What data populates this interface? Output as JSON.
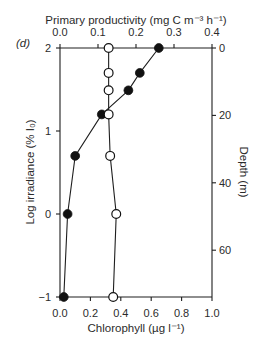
{
  "panel_label": "(d)",
  "chart_data": {
    "type": "line",
    "title": "",
    "panel": "(d)",
    "orientation": "vertical-profile",
    "top_axis": {
      "label": "Primary productivity (mg C m⁻³ h⁻¹)",
      "range": [
        0,
        0.4
      ],
      "ticks": [
        0.0,
        0.1,
        0.2,
        0.3,
        0.4
      ],
      "tick_labels": [
        "0.0",
        "0.1",
        "0.2",
        "0.3",
        "0.4"
      ]
    },
    "bottom_axis": {
      "label": "Chlorophyll (µg l⁻¹)",
      "range": [
        0,
        1.0
      ],
      "ticks": [
        0.0,
        0.2,
        0.4,
        0.6,
        0.8,
        1.0
      ],
      "tick_labels": [
        "0.0",
        "0.2",
        "0.4",
        "0.6",
        "0.8",
        "1.0"
      ]
    },
    "left_axis": {
      "label": "Log irradiance (% I₀)",
      "range": [
        -1,
        2
      ],
      "ticks": [
        2,
        1,
        0,
        -1
      ],
      "tick_labels": [
        "2",
        "1",
        "0",
        "−1"
      ]
    },
    "right_axis": {
      "label": "Depth (m)",
      "range": [
        0,
        74
      ],
      "ticks": [
        0,
        20,
        40,
        60
      ],
      "tick_labels": [
        "0",
        "20",
        "40",
        "60"
      ]
    },
    "grid": false,
    "legend": null,
    "log_irradiance": [
      2.0,
      1.7,
      1.49,
      1.2,
      0.7,
      0.0,
      -1.0
    ],
    "series": [
      {
        "name": "Primary productivity",
        "marker": "filled-circle",
        "axis": "top",
        "values": [
          0.26,
          0.21,
          0.18,
          0.11,
          0.04,
          0.02,
          0.01
        ]
      },
      {
        "name": "Chlorophyll",
        "marker": "open-circle",
        "axis": "bottom",
        "values": [
          0.32,
          0.32,
          0.32,
          0.32,
          0.33,
          0.37,
          0.35
        ]
      }
    ]
  }
}
